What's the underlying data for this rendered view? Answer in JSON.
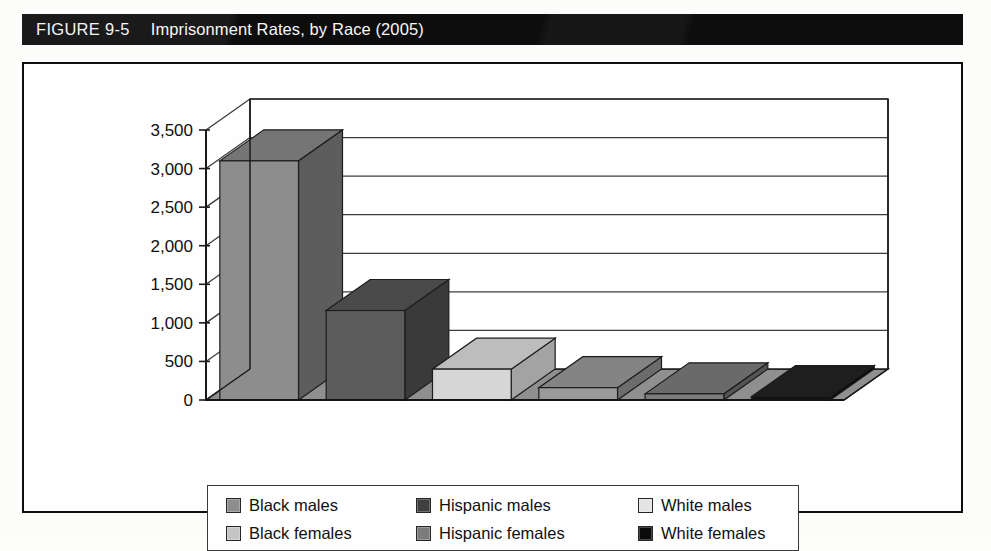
{
  "figure": {
    "number_label": "FIGURE 9-5",
    "title": "Imprisonment Rates, by Race (2005)"
  },
  "colors": {
    "title_bar_bg": "#0d0d0d",
    "title_text": "#f5f5f3",
    "frame_border": "#0e0e0e",
    "plot_bg": "#fefefe",
    "gridline": "#3c3c3c",
    "axis": "#1a1a1a",
    "floor_fill": "#8f8f8f",
    "legend_border": "#3a3a3a"
  },
  "chart_data": {
    "type": "bar",
    "title": "Imprisonment Rates, by Race (2005)",
    "xlabel": "",
    "ylabel": "",
    "ylim": [
      0,
      3500
    ],
    "ytick_labels": [
      "0",
      "500",
      "1,000",
      "1,500",
      "2,000",
      "2,500",
      "3,000",
      "3,500"
    ],
    "ytick_values": [
      0,
      500,
      1000,
      1500,
      2000,
      2500,
      3000,
      3500
    ],
    "grid": true,
    "three_d": true,
    "legend_position": "bottom",
    "categories": [
      "Black males",
      "Hispanic males",
      "Black females",
      "White males",
      "Hispanic females",
      "White females"
    ],
    "bars": [
      {
        "label": "Black males",
        "value": 3100,
        "face": "#8d8d8d",
        "top": "#757575",
        "side": "#5d5d5d"
      },
      {
        "label": "Hispanic males",
        "value": 1160,
        "face": "#5c5c5c",
        "top": "#4a4a4a",
        "side": "#3a3a3a"
      },
      {
        "label": "Black females",
        "value": 400,
        "face": "#d6d6d6",
        "top": "#bdbdbd",
        "side": "#a3a3a3"
      },
      {
        "label": "White males",
        "value": 160,
        "face": "#9a9a9a",
        "top": "#848484",
        "side": "#6c6c6c"
      },
      {
        "label": "Hispanic females",
        "value": 80,
        "face": "#7d7d7d",
        "top": "#6a6a6a",
        "side": "#545454"
      },
      {
        "label": "White females",
        "value": 45,
        "face": "#121212",
        "top": "#1e1e1e",
        "side": "#0a0a0a"
      }
    ]
  },
  "legend": {
    "entries": [
      {
        "label": "Black males",
        "swatch": "#8d8d8d"
      },
      {
        "label": "Hispanic males",
        "swatch": "#3f3f3f"
      },
      {
        "label": "White males",
        "swatch": "#e4e4e4"
      },
      {
        "label": "Black females",
        "swatch": "#c4c4c4"
      },
      {
        "label": "Hispanic females",
        "swatch": "#7b7b7b"
      },
      {
        "label": "White females",
        "swatch": "#0b0b0b"
      }
    ]
  }
}
